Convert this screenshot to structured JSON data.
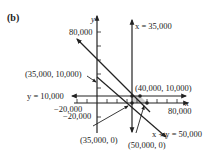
{
  "figure": {
    "panel_label": "(b)",
    "axes": {
      "x_label": "x",
      "y_label": "y",
      "x_ticks_labeled": [
        "−20,000",
        "80,000"
      ],
      "y_ticks_labeled": [
        "80,000",
        "−20,000"
      ]
    },
    "lines": [
      {
        "label": "x = 35,000",
        "type": "vertical"
      },
      {
        "label": "y = 10,000",
        "type": "horizontal"
      },
      {
        "label": "x + y = 50,000",
        "type": "diagonal"
      },
      {
        "label": "",
        "type": "diagonal",
        "note": "upper boundary line"
      }
    ],
    "points": [
      {
        "label": "(35,000, 10,000)"
      },
      {
        "label": "(40,000, 10,000)"
      },
      {
        "label": "(35,000, 0)"
      },
      {
        "label": "(50,000, 0)"
      }
    ],
    "colors": {
      "ink": "#222222",
      "shade": "#cfcfcf"
    }
  }
}
